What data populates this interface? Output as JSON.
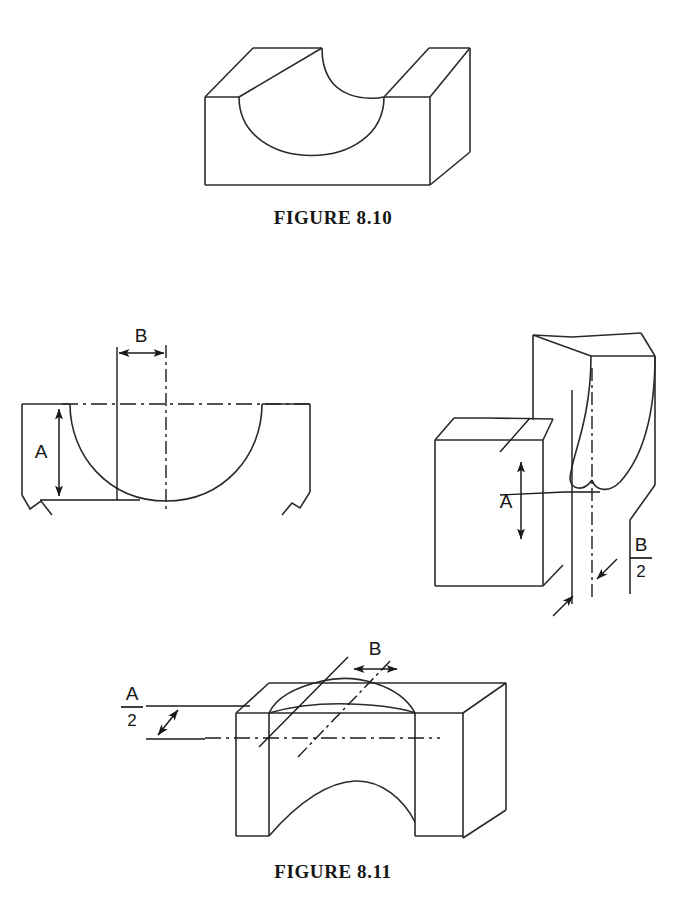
{
  "page": {
    "background": "#ffffff",
    "line_color": "#2a2a2a",
    "width": 673,
    "height": 906
  },
  "figures": [
    {
      "id": "figure-8-10",
      "caption": "FIGURE 8.10",
      "description": "Isometric view of a rectangular block with a semicircular concave groove machined across its top face",
      "caption_x": 333,
      "caption_y": 224
    },
    {
      "id": "figure-8-11",
      "caption": "FIGURE 8.11",
      "description": "Three views showing dimensions A and B of a concave radius feature",
      "caption_x": 333,
      "caption_y": 878
    }
  ],
  "labels": {
    "front_view": {
      "depth_label": "A",
      "width_label": "B"
    },
    "iso_right_view": {
      "depth_label": "A",
      "half_width_numerator": "B",
      "half_width_denominator": "2"
    },
    "iso_bottom_view": {
      "half_depth_numerator": "A",
      "half_depth_denominator": "2",
      "width_label": "B"
    }
  },
  "dimensions": {
    "A": "A",
    "B": "B",
    "A_over_2": "A/2",
    "B_over_2": "B/2"
  }
}
